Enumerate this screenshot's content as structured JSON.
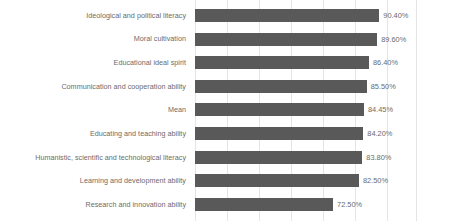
{
  "chart_data": {
    "type": "bar",
    "orientation": "horizontal",
    "title": "",
    "xlabel": "",
    "ylabel": "",
    "grid": true,
    "legend": "none",
    "xlim": [
      19.0,
      105.0
    ],
    "value_suffix": "%",
    "bar_color": "#595959",
    "gridline_color": "#e4e4e4",
    "label_color": "#6b6b6b",
    "background": "#ffffff",
    "categories": [
      "Ideological and political literacy",
      "Moral cultivation",
      "Educational ideal spirit",
      "Communication and cooperation ability",
      "Mean",
      "Educating and teaching ability",
      "Humanistic, scientific and technological literacy",
      "Learning and development ability",
      "Research and innovation ability"
    ],
    "values": [
      90.4,
      89.6,
      86.4,
      85.5,
      84.45,
      84.2,
      83.8,
      82.5,
      72.5
    ],
    "value_labels": [
      "90.40%",
      "89.60%",
      "86.40%",
      "85.50%",
      "84.45%",
      "84.20%",
      "83.80%",
      "82.50%",
      "72.50%"
    ],
    "gridline_positions_px": [
      0,
      32,
      64,
      96,
      128,
      160,
      192,
      222
    ]
  }
}
